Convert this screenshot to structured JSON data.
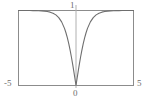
{
  "figure": {
    "background_color": "#ffffff",
    "frame_color": "#8c8c8c",
    "axis_color": "#b0b0b0",
    "curve_color": "#6e6e6e",
    "label_color": "#6d6d6d"
  },
  "labels": {
    "y_max": "1",
    "x_min": "-5",
    "x_max": "5",
    "origin": "0"
  },
  "chart_data": {
    "type": "line",
    "title": "",
    "xlabel": "",
    "ylabel": "",
    "xlim": [
      -5,
      5
    ],
    "ylim": [
      0,
      1
    ],
    "grid": false,
    "legend": null,
    "frame": true,
    "vertical_axis_at": 0,
    "tick_labels": {
      "x": [
        "-5",
        "0",
        "5"
      ],
      "y": [
        "0",
        "1"
      ]
    },
    "series": [
      {
        "name": "|tanh(x)|",
        "x": [
          -5,
          -4.75,
          -4.5,
          -4.25,
          -4,
          -3.75,
          -3.5,
          -3.25,
          -3,
          -2.75,
          -2.5,
          -2.25,
          -2,
          -1.75,
          -1.5,
          -1.25,
          -1,
          -0.875,
          -0.75,
          -0.625,
          -0.5,
          -0.4,
          -0.3,
          -0.25,
          -0.2,
          -0.15,
          -0.1,
          -0.05,
          0,
          0.05,
          0.1,
          0.15,
          0.2,
          0.25,
          0.3,
          0.4,
          0.5,
          0.625,
          0.75,
          0.875,
          1,
          1.25,
          1.5,
          1.75,
          2,
          2.25,
          2.5,
          2.75,
          3,
          3.25,
          3.5,
          3.75,
          4,
          4.25,
          4.5,
          4.75,
          5
        ],
        "y": [
          0.9999,
          0.9999,
          0.9998,
          0.9996,
          0.9993,
          0.9989,
          0.9982,
          0.997,
          0.995,
          0.9919,
          0.9866,
          0.978,
          0.964,
          0.9414,
          0.9051,
          0.8483,
          0.7616,
          0.7036,
          0.6351,
          0.5556,
          0.4621,
          0.3799,
          0.2913,
          0.2449,
          0.1974,
          0.1489,
          0.0997,
          0.05,
          0.0,
          0.05,
          0.0997,
          0.1489,
          0.1974,
          0.2449,
          0.2913,
          0.3799,
          0.4621,
          0.5556,
          0.6351,
          0.7036,
          0.7616,
          0.8483,
          0.9051,
          0.9414,
          0.964,
          0.978,
          0.9866,
          0.9919,
          0.995,
          0.997,
          0.9982,
          0.9989,
          0.9993,
          0.9996,
          0.9998,
          0.9999,
          0.9999
        ]
      }
    ]
  }
}
